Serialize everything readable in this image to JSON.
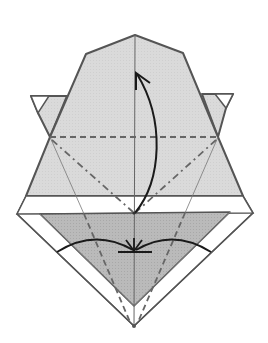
{
  "diagram": {
    "colors": {
      "background": "#ffffff",
      "paper_light": "#dcdcdc",
      "paper_dark": "#b9b9b9",
      "paper_white": "#ffffff",
      "outline": "#555555",
      "fold_line": "#666666",
      "arrow": "#1a1a1a"
    },
    "symbols": [
      {
        "name": "valley-fold",
        "style": "dashed"
      },
      {
        "name": "mountain-fold",
        "style": "dash-dot"
      },
      {
        "name": "fold-up-arrow",
        "style": "curved-arrow"
      },
      {
        "name": "push-in-arrows",
        "style": "converging-arcs"
      }
    ]
  }
}
